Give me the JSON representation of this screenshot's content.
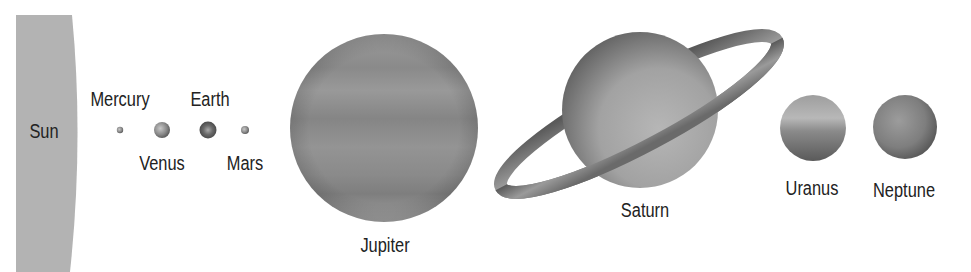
{
  "diagram": {
    "background": "#ffffff",
    "bodies": [
      {
        "name": "Sun",
        "label": "Sun",
        "shape": "partial-disc",
        "color": "#b3b3b3",
        "x": 16,
        "top": 15,
        "right_edge_top": 72,
        "right_edge_mid": 78,
        "right_edge_bottom": 70,
        "label_x": 44,
        "label_y": 131
      },
      {
        "name": "Mercury",
        "label": "Mercury",
        "cx": 120,
        "cy": 130,
        "r": 3,
        "color": "#777777",
        "label_x": 120,
        "label_y": 99
      },
      {
        "name": "Venus",
        "label": "Venus",
        "cx": 162,
        "cy": 130,
        "r": 8,
        "color": "#9a9a9a",
        "label_x": 162,
        "label_y": 163
      },
      {
        "name": "Earth",
        "label": "Earth",
        "cx": 208,
        "cy": 130,
        "r": 8,
        "color": "#6a6a6a",
        "label_x": 210,
        "label_y": 99
      },
      {
        "name": "Mars",
        "label": "Mars",
        "cx": 245,
        "cy": 130,
        "r": 4,
        "color": "#808080",
        "label_x": 245,
        "label_y": 163
      },
      {
        "name": "Jupiter",
        "label": "Jupiter",
        "cx": 384,
        "cy": 128,
        "r": 94,
        "color": "#8e8e8e",
        "label_x": 385,
        "label_y": 245
      },
      {
        "name": "Saturn",
        "label": "Saturn",
        "cx": 640,
        "cy": 110,
        "r": 78,
        "color": "#a0a0a0",
        "ring": {
          "x1": 500,
          "y1": 188,
          "x2": 778,
          "y2": 40,
          "color": "#8a8a8a"
        },
        "label_x": 645,
        "label_y": 210
      },
      {
        "name": "Uranus",
        "label": "Uranus",
        "cx": 813,
        "cy": 128,
        "r": 33,
        "color": "#a5a5a5",
        "label_x": 812,
        "label_y": 188
      },
      {
        "name": "Neptune",
        "label": "Neptune",
        "cx": 905,
        "cy": 127,
        "r": 32,
        "color": "#858585",
        "label_x": 904,
        "label_y": 190
      }
    ]
  }
}
